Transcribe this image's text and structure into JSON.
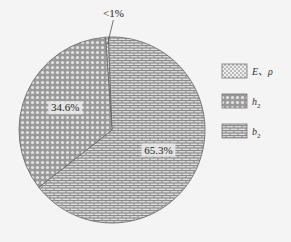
{
  "chart_data": {
    "type": "pie",
    "title": "",
    "slices": [
      {
        "key": "E",
        "legend_main": "E、ρ",
        "legend_sub": "",
        "value": 0.5,
        "label": "<1%",
        "pattern": "dots",
        "label_style": "callout"
      },
      {
        "key": "b2",
        "legend_main": "b",
        "legend_sub": "2",
        "value": 65.3,
        "label": "65.3%",
        "pattern": "bricks",
        "label_style": "inside"
      },
      {
        "key": "h2",
        "legend_main": "h",
        "legend_sub": "2",
        "value": 34.6,
        "label": "34.6%",
        "pattern": "circles",
        "label_style": "inside"
      }
    ],
    "legend_order": [
      "E",
      "h2",
      "b2"
    ],
    "legend_placement": "right",
    "start_angle_deg": -4,
    "direction": "clockwise"
  }
}
